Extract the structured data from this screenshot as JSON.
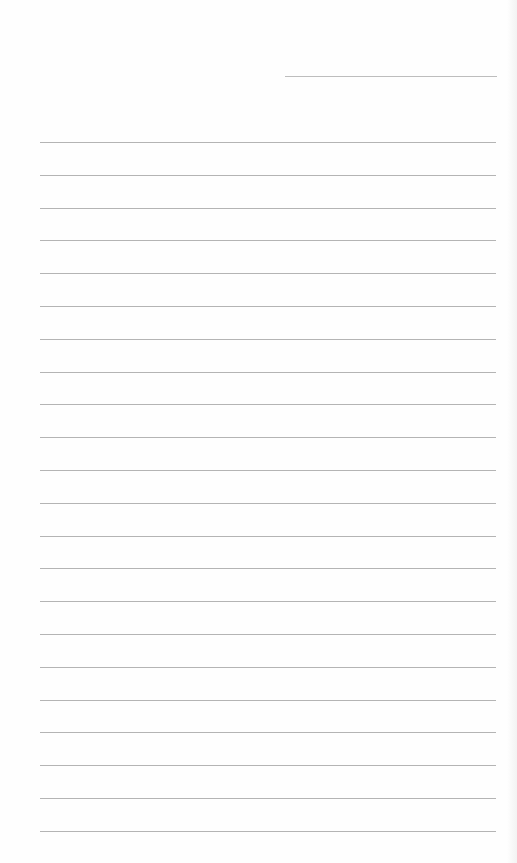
{
  "document": {
    "type": "lined-paper",
    "header_line": {
      "present": true
    },
    "rules": {
      "count": 22,
      "first_y": 142,
      "spacing": 32.8,
      "color": "#b4b4b4"
    },
    "text": []
  }
}
